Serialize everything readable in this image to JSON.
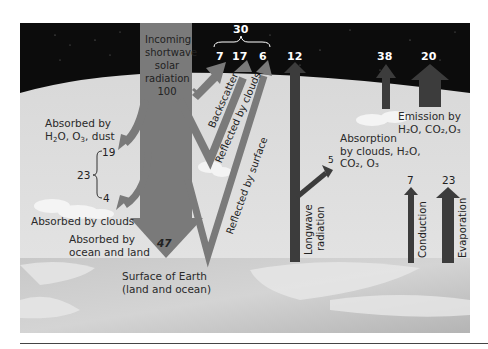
{
  "diagram": {
    "colors": {
      "sky": "#0c0c0c",
      "atmosphere": "#dcdcdc",
      "earth": "#bdbdbd",
      "shortwave_arrow": "#7a7a7a",
      "longwave_arrow": "#3c3c3c",
      "rule": "#444444"
    },
    "incoming": {
      "label_lines": [
        "Incoming",
        "shortwave",
        "solar",
        "radiation"
      ],
      "value": "100"
    },
    "reflected": {
      "total": "30",
      "backscatter": {
        "value": "7",
        "label": "Backscatter"
      },
      "clouds": {
        "value": "17",
        "label": "Reflected by clouds"
      },
      "surface": {
        "value": "6",
        "label": "Reflected by surface"
      }
    },
    "absorbed_atmosphere": {
      "label_line1": "Absorbed by",
      "label_line2_parts": [
        "H",
        "2",
        "O, O",
        "3",
        ", dust"
      ],
      "dust_value": "19",
      "total": "23",
      "clouds_value": "4",
      "clouds_label": "Absorbed by clouds"
    },
    "absorbed_surface": {
      "label_lines": [
        "Absorbed by",
        "ocean and land"
      ],
      "value": "47"
    },
    "surface_label_lines": [
      "Surface of Earth",
      "(land and ocean)"
    ],
    "longwave": {
      "value_to_space": "12",
      "label_lines": [
        "Longwave",
        "radiation"
      ],
      "absorbed_value": "5",
      "absorption_label_line1": "Absorption",
      "absorption_label_line2": "by clouds, H₂O,",
      "absorption_label_line3": "CO₂, O₃"
    },
    "emission": {
      "clouds_value": "38",
      "gases_value": "20",
      "label_line1": "Emission by",
      "label_line2": "H₂O, CO₂,O₃"
    },
    "conduction": {
      "value": "7",
      "label": "Conduction"
    },
    "evaporation": {
      "value": "23",
      "label": "Evaporation"
    }
  }
}
